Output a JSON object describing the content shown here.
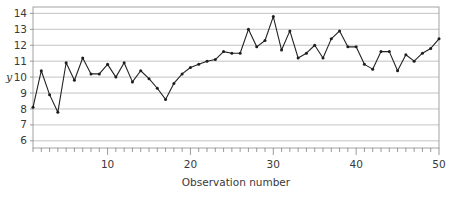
{
  "chart_data": {
    "type": "line",
    "title": "",
    "xlabel": "Observation number",
    "ylabel": "y",
    "xlim": [
      1,
      50
    ],
    "ylim": [
      5.5,
      14.4
    ],
    "grid": true,
    "legend": false,
    "marker": "filled-circle",
    "line_color": "#232323",
    "grid_color": "#9a9a9a",
    "y_ticks": [
      6,
      7,
      8,
      9,
      10,
      11,
      12,
      13,
      14
    ],
    "y_tick_labels": [
      "6",
      "7",
      "8",
      "9",
      "10",
      "11",
      "12",
      "13",
      "14"
    ],
    "x_ticks": [
      10,
      20,
      30,
      40,
      50
    ],
    "x_tick_labels": [
      "10",
      "20",
      "30",
      "40",
      "50"
    ],
    "x_minor_tick_step": 1,
    "x": [
      1,
      2,
      3,
      4,
      5,
      6,
      7,
      8,
      9,
      10,
      11,
      12,
      13,
      14,
      15,
      16,
      17,
      18,
      19,
      20,
      21,
      22,
      23,
      24,
      25,
      26,
      27,
      28,
      29,
      30,
      31,
      32,
      33,
      34,
      35,
      36,
      37,
      38,
      39,
      40,
      41,
      42,
      43,
      44,
      45,
      46,
      47,
      48,
      49,
      50
    ],
    "values": [
      8.1,
      10.4,
      8.9,
      7.8,
      10.9,
      9.8,
      11.2,
      10.2,
      10.2,
      10.8,
      10.0,
      10.9,
      9.7,
      10.4,
      9.9,
      9.3,
      8.6,
      9.6,
      10.2,
      10.6,
      10.8,
      11.0,
      11.1,
      11.6,
      11.5,
      11.5,
      13.0,
      11.9,
      12.3,
      13.8,
      11.7,
      12.9,
      11.2,
      11.5,
      12.0,
      11.2,
      12.4,
      12.9,
      11.9,
      11.9,
      10.8,
      10.5,
      11.6,
      11.6,
      10.4,
      11.4,
      11.0,
      11.5,
      11.8,
      12.4
    ],
    "series": [
      {
        "name": "y",
        "values": [
          8.1,
          10.4,
          8.9,
          7.8,
          10.9,
          9.8,
          11.2,
          10.2,
          10.2,
          10.8,
          10.0,
          10.9,
          9.7,
          10.4,
          9.9,
          9.3,
          8.6,
          9.6,
          10.2,
          10.6,
          10.8,
          11.0,
          11.1,
          11.6,
          11.5,
          11.5,
          13.0,
          11.9,
          12.3,
          13.8,
          11.7,
          12.9,
          11.2,
          11.5,
          12.0,
          11.2,
          12.4,
          12.9,
          11.9,
          11.9,
          10.8,
          10.5,
          11.6,
          11.6,
          10.4,
          11.4,
          11.0,
          11.5,
          11.8,
          12.4
        ]
      }
    ]
  }
}
